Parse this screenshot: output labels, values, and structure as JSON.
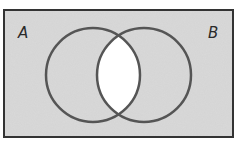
{
  "diagram": {
    "type": "venn",
    "sets": [
      {
        "label": "A",
        "cx": 93,
        "cy": 75,
        "r": 47
      },
      {
        "label": "B",
        "cx": 144,
        "cy": 75,
        "r": 47
      }
    ],
    "shaded_region": "complement of A ∩ B",
    "unshaded_region": "A ∩ B",
    "universal_set": {
      "x": 4,
      "y": 10,
      "width": 229,
      "height": 127
    },
    "colors": {
      "shade": "#d9d9d9",
      "unshaded": "#ffffff",
      "circle_stroke": "#555555",
      "border": "#333333",
      "label": "#2a2a2a"
    }
  },
  "labels": {
    "set_a": "A",
    "set_b": "B"
  }
}
